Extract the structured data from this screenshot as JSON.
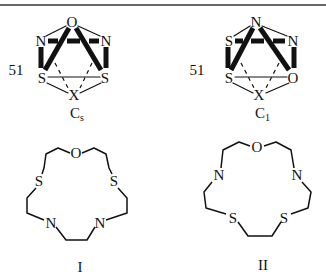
{
  "figure": {
    "top_rule": true,
    "structures": [
      {
        "id": "cage-cs",
        "label_number": "51",
        "symmetry": {
          "main": "C",
          "subscript": "s"
        },
        "atoms": {
          "top": "O",
          "upper_left": "N",
          "upper_right": "N",
          "lower_left": "S",
          "lower_right": "S",
          "bottom": "X"
        }
      },
      {
        "id": "cage-c1",
        "label_number": "51",
        "symmetry": {
          "main": "C",
          "subscript": "1"
        },
        "atoms": {
          "top": "N",
          "upper_left": "S",
          "upper_right": "N",
          "lower_left": "S",
          "lower_right": "O",
          "bottom": "X"
        }
      },
      {
        "id": "macrocycle-I",
        "caption": "I",
        "atoms": {
          "top": "O",
          "left_upper": "S",
          "right_upper": "S",
          "left_lower": "N",
          "right_lower": "N"
        }
      },
      {
        "id": "macrocycle-II",
        "caption": "II",
        "atoms": {
          "top": "O",
          "left_upper": "N",
          "right_upper": "N",
          "left_lower": "S",
          "right_lower": "S"
        }
      }
    ]
  }
}
